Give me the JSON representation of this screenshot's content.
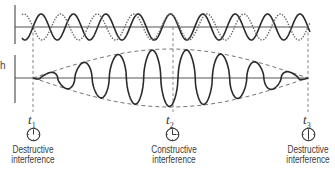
{
  "diagram": {
    "title": "",
    "side_label": "h",
    "top_panel": {
      "description": "Two component waves with slightly different frequencies",
      "wave_solid": "solid wave",
      "wave_dotted": "dotted wave"
    },
    "bottom_panel": {
      "description": "Resultant wave showing beats with dashed envelope"
    },
    "markers": [
      {
        "id": "t1",
        "symbol": "t",
        "subscript": "1",
        "line1": "Destructive",
        "line2": "interference",
        "icon": "clock-icon"
      },
      {
        "id": "t2",
        "symbol": "t",
        "subscript": "2",
        "line1": "Constructive",
        "line2": "interference",
        "icon": "clock-icon"
      },
      {
        "id": "t3",
        "symbol": "t",
        "subscript": "3",
        "line1": "Destructive",
        "line2": "interference",
        "icon": "clock-icon"
      }
    ],
    "colors": {
      "stroke": "#2b2b2b",
      "dashed": "#777777",
      "axis": "#555555"
    }
  }
}
